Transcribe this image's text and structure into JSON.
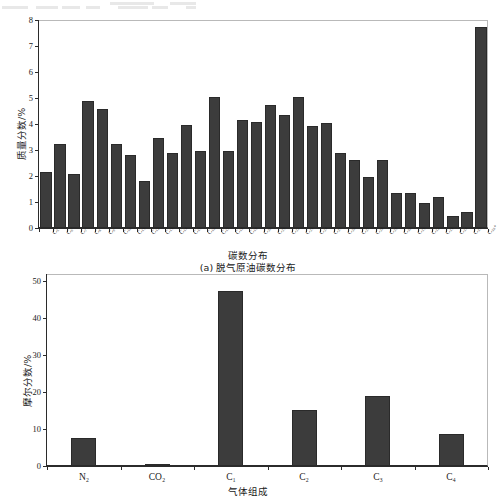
{
  "page": {
    "background_color": "#ffffff",
    "bar_color": "#3c3c3c",
    "axis_color": "#2b2b2b",
    "frame_color": "#b9b9b9"
  },
  "chart_data": [
    {
      "id": "carbon-number-distribution",
      "type": "bar",
      "title": "",
      "caption": "(a) 脱气原油碳数分布",
      "xlabel": "碳数分布",
      "ylabel": "质量分数/%",
      "ylim": [
        0,
        8
      ],
      "yticks": [
        0,
        1,
        2,
        3,
        4,
        5,
        6,
        7,
        8
      ],
      "ytick_labels": [
        "0",
        "1",
        "2",
        "3",
        "4",
        "5",
        "6",
        "7",
        "8"
      ],
      "grid": false,
      "legend": "none",
      "categories": [
        "C5",
        "C6",
        "C7",
        "C8",
        "C9",
        "C10",
        "C11",
        "C12",
        "C13",
        "C14",
        "C15",
        "C16",
        "C17",
        "C18",
        "C19",
        "C20",
        "C21",
        "C22",
        "C23",
        "C24",
        "C25",
        "C26",
        "C27",
        "C28",
        "C29",
        "C30",
        "C31",
        "C32",
        "C33",
        "C34",
        "C35",
        "C36+"
      ],
      "category_labels": [
        "C₅",
        "C₆",
        "C₇",
        "C₈",
        "C₉",
        "C₁₀",
        "C₁₁",
        "C₁₂",
        "C₁₃",
        "C₁₄",
        "C₁₅",
        "C₁₆",
        "C₁₇",
        "C₁₈",
        "C₁₉",
        "C₂₀",
        "C₂₁",
        "C₂₂",
        "C₂₃",
        "C₂₄",
        "C₂₅",
        "C₂₆",
        "C₂₇",
        "C₂₈",
        "C₂₉",
        "C₃₀",
        "C₃₁",
        "C₃₂",
        "C₃₃",
        "C₃₄",
        "C₃₅",
        "C₃₆₊"
      ],
      "values": [
        2.15,
        3.25,
        2.08,
        4.88,
        4.58,
        3.24,
        2.8,
        1.82,
        3.45,
        2.87,
        3.95,
        2.95,
        5.02,
        2.96,
        4.17,
        4.08,
        4.75,
        4.35,
        5.02,
        3.93,
        4.03,
        2.87,
        2.6,
        1.97,
        2.63,
        1.36,
        1.33,
        0.98,
        1.2,
        0.47,
        0.6,
        7.72
      ]
    },
    {
      "id": "gas-composition",
      "type": "bar",
      "title": "",
      "caption": "",
      "xlabel": "气体组成",
      "ylabel": "摩尔分数/%",
      "ylim": [
        0,
        52
      ],
      "yticks": [
        0,
        10,
        20,
        30,
        40,
        50
      ],
      "ytick_labels": [
        "0",
        "10",
        "20",
        "30",
        "40",
        "50"
      ],
      "grid": false,
      "legend": "none",
      "categories": [
        "N2",
        "CO2",
        "C1",
        "C2",
        "C3",
        "C4"
      ],
      "category_labels": [
        "N₂",
        "CO₂",
        "C₁",
        "C₂",
        "C₃",
        "C₄"
      ],
      "values": [
        7.7,
        0.4,
        47.3,
        15.1,
        19.0,
        8.7
      ]
    }
  ]
}
